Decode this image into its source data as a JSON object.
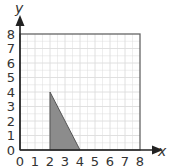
{
  "chart_data": {
    "type": "area",
    "title": "",
    "xlabel": "x",
    "ylabel": "y",
    "xlim": [
      0,
      8
    ],
    "ylim": [
      0,
      8
    ],
    "grid": true,
    "x_ticks": [
      "0",
      "1",
      "2",
      "3",
      "4",
      "5",
      "6",
      "7",
      "8"
    ],
    "y_ticks": [
      "0",
      "1",
      "2",
      "3",
      "4",
      "5",
      "6",
      "7",
      "8"
    ],
    "shape": {
      "name": "shaded-triangle",
      "vertices": [
        [
          2,
          0
        ],
        [
          2,
          4
        ],
        [
          4,
          0
        ]
      ],
      "fill": "#8c8c8c",
      "stroke": "#555555"
    }
  },
  "colors": {
    "grid": "#dcdcdc",
    "border": "#666666",
    "axis": "#222222"
  }
}
